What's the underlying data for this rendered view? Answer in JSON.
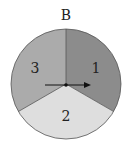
{
  "title": "B",
  "spinner": {
    "center": [
      66,
      84
    ],
    "radius": 55,
    "sectors": [
      {
        "label": "1",
        "color": "#8c8c8c",
        "start_deg": -90,
        "end_deg": 30,
        "label_pos": [
          96,
          73
        ]
      },
      {
        "label": "2",
        "color": "#dedede",
        "start_deg": 30,
        "end_deg": 150,
        "label_pos": [
          66,
          121
        ]
      },
      {
        "label": "3",
        "color": "#ababab",
        "start_deg": 150,
        "end_deg": 270,
        "label_pos": [
          35,
          73
        ]
      }
    ],
    "arrow": {
      "from": [
        45,
        85
      ],
      "to": [
        90,
        85
      ],
      "direction": "right"
    }
  }
}
